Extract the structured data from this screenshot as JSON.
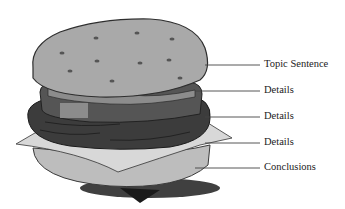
{
  "diagram": {
    "labels": [
      {
        "text": "Topic Sentence",
        "part": "top bun"
      },
      {
        "text": "Details",
        "part": "lettuce/tomato layer"
      },
      {
        "text": "Details",
        "part": "patty"
      },
      {
        "text": "Details",
        "part": "cheese"
      },
      {
        "text": "Conclusions",
        "part": "bottom bun"
      }
    ]
  },
  "colors": {
    "bun": "#a9a9a9",
    "bun_outline": "#3a3a3a",
    "patty": "#3c3c3c",
    "lettuce_ring": "#555555",
    "cheese": "#d4d4d4",
    "bottom_bun": "#bdbdbd",
    "leader_line": "#444444",
    "shadow": "#1a1a1a"
  }
}
